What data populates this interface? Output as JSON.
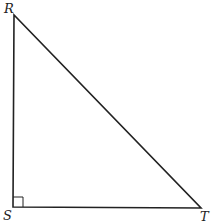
{
  "diagram": {
    "type": "right-triangle",
    "vertices": [
      {
        "label": "R",
        "x": 14,
        "y": 15
      },
      {
        "label": "S",
        "x": 13,
        "y": 207
      },
      {
        "label": "T",
        "x": 201,
        "y": 208
      }
    ],
    "right_angle_at": "S",
    "stroke_color": "#222222",
    "background": "#ffffff"
  }
}
